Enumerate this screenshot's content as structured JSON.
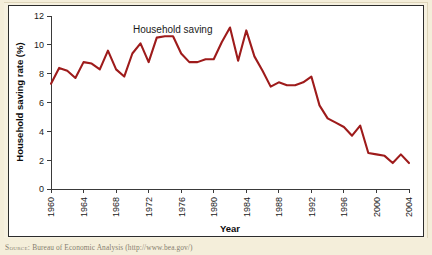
{
  "figure": {
    "source_note_label": "Source:",
    "source_note_text": "Bureau of Economic Analysis (http://www.bea.gov/)",
    "line_color": "#9e1b1b",
    "plot_background": "#ffffff",
    "page_background": "#f4eeda",
    "axis_color": "#3a3a3a"
  },
  "chart_data": {
    "type": "line",
    "title": "",
    "annotation": "Household saving",
    "xlabel": "Year",
    "ylabel": "Household saving rate (%)",
    "xlim": [
      1960,
      2004
    ],
    "ylim": [
      0,
      12
    ],
    "grid": false,
    "legend_position": "none",
    "y_ticks": [
      0,
      2,
      4,
      6,
      8,
      10,
      12
    ],
    "y_tick_labels": [
      "0",
      "2",
      "4",
      "6",
      "8",
      "10",
      "12"
    ],
    "x_ticks": [
      1960,
      1964,
      1968,
      1972,
      1976,
      1980,
      1984,
      1988,
      1992,
      1996,
      2000,
      2004
    ],
    "x_tick_labels": [
      "1960",
      "1964",
      "1968",
      "1972",
      "1976",
      "1980",
      "1984",
      "1988",
      "1992",
      "1996",
      "2000",
      "2004"
    ],
    "series": [
      {
        "name": "Household saving",
        "color": "#9e1b1b",
        "x": [
          1960,
          1961,
          1962,
          1963,
          1964,
          1965,
          1966,
          1967,
          1968,
          1969,
          1970,
          1971,
          1972,
          1973,
          1974,
          1975,
          1976,
          1977,
          1978,
          1979,
          1980,
          1981,
          1982,
          1983,
          1984,
          1985,
          1986,
          1987,
          1988,
          1989,
          1990,
          1991,
          1992,
          1993,
          1994,
          1995,
          1996,
          1997,
          1998,
          1999,
          2000,
          2001,
          2002,
          2003,
          2004
        ],
        "values": [
          7.3,
          8.4,
          8.2,
          7.7,
          8.8,
          8.7,
          8.3,
          9.6,
          8.3,
          7.8,
          9.4,
          10.1,
          8.8,
          10.5,
          10.6,
          10.6,
          9.4,
          8.8,
          8.8,
          9.0,
          9.0,
          10.2,
          11.2,
          8.9,
          11.0,
          9.2,
          8.2,
          7.1,
          7.4,
          7.2,
          7.2,
          7.4,
          7.8,
          5.8,
          4.9,
          4.6,
          4.3,
          3.7,
          4.4,
          2.5,
          2.4,
          2.3,
          1.8,
          2.4,
          1.8
        ]
      }
    ]
  }
}
